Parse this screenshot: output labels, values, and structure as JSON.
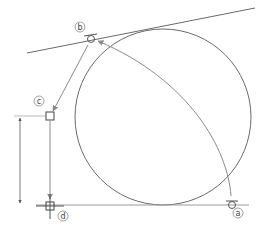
{
  "diagram": {
    "colors": {
      "stroke": "#6a6a6a",
      "arrow": "#8a8a8a",
      "construction": "#9a9a9a",
      "label": "#444444",
      "background": "#ffffff"
    },
    "circle": {
      "cx": 163,
      "cy": 117,
      "r": 88
    },
    "tangent_line": {
      "x1": 27,
      "y1": 53,
      "x2": 255,
      "y2": 8
    },
    "baseline": {
      "x1": 36,
      "y1": 205,
      "x2": 249,
      "y2": 205
    },
    "points": {
      "a": {
        "label": "a",
        "x": 232,
        "y": 205,
        "marker": "tangent-circle",
        "label_x": 238,
        "label_y": 215
      },
      "b": {
        "label": "b",
        "x": 91,
        "y": 39,
        "marker": "tangent-circle",
        "label_x": 80,
        "label_y": 27
      },
      "c": {
        "label": "c",
        "x": 50,
        "y": 116,
        "marker": "square",
        "label_x": 38,
        "label_y": 101
      },
      "d": {
        "label": "d",
        "x": 50,
        "y": 206,
        "marker": "square-cross",
        "label_x": 62,
        "label_y": 216
      }
    },
    "arrows": [
      {
        "from": "a",
        "to": "b",
        "kind": "curve"
      },
      {
        "from": "b",
        "to": "c",
        "kind": "straight"
      },
      {
        "from": "c",
        "to": "d",
        "kind": "straight"
      }
    ],
    "dimension": {
      "x": 20,
      "y1": 116,
      "y2": 205
    }
  }
}
